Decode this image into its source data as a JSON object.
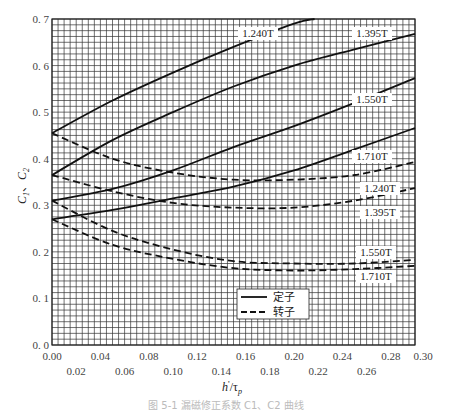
{
  "chart_data": {
    "type": "line",
    "title": "",
    "xlabel": "h'/τp",
    "ylabel": "C1、C2",
    "xlim": [
      0.0,
      0.3
    ],
    "ylim": [
      0.0,
      0.7
    ],
    "grid": true,
    "x_ticks_upper": [
      "0.00",
      "0.04",
      "0.08",
      "0.12",
      "0.16",
      "0.20",
      "0.24",
      "0.28",
      "0.30"
    ],
    "x_ticks_lower": [
      "0.02",
      "0.06",
      "0.10",
      "0.14",
      "0.18",
      "0.22",
      "0.26"
    ],
    "y_ticks": [
      "0.0",
      "0.1",
      "0.2",
      "0.3",
      "0.4",
      "0.5",
      "0.6",
      "0.7"
    ],
    "legend": [
      {
        "label": "定子",
        "style": "solid"
      },
      {
        "label": "转子",
        "style": "dashed"
      }
    ],
    "legend_position": "lower-right inside",
    "series": [
      {
        "name": "定子 1.240T",
        "style": "solid",
        "label": "1.240T",
        "x": [
          0.0,
          0.05,
          0.1,
          0.15,
          0.2,
          0.217
        ],
        "values": [
          0.455,
          0.525,
          0.585,
          0.64,
          0.69,
          0.7
        ]
      },
      {
        "name": "定子 1.395T",
        "style": "solid",
        "label": "1.395T",
        "x": [
          0.0,
          0.05,
          0.1,
          0.15,
          0.2,
          0.25,
          0.3
        ],
        "values": [
          0.365,
          0.44,
          0.5,
          0.555,
          0.6,
          0.635,
          0.668
        ]
      },
      {
        "name": "定子 1.550T",
        "style": "solid",
        "label": "1.550T",
        "x": [
          0.0,
          0.05,
          0.1,
          0.15,
          0.2,
          0.25,
          0.3
        ],
        "values": [
          0.31,
          0.335,
          0.375,
          0.425,
          0.47,
          0.52,
          0.573
        ]
      },
      {
        "name": "定子 1.710T",
        "style": "solid",
        "label": "1.710T",
        "x": [
          0.0,
          0.05,
          0.1,
          0.15,
          0.2,
          0.25,
          0.3
        ],
        "values": [
          0.27,
          0.29,
          0.315,
          0.34,
          0.375,
          0.42,
          0.466
        ]
      },
      {
        "name": "转子 1.240T",
        "style": "dashed",
        "label": "1.240T",
        "x": [
          0.0,
          0.05,
          0.1,
          0.15,
          0.2,
          0.25,
          0.3
        ],
        "values": [
          0.455,
          0.4,
          0.37,
          0.355,
          0.355,
          0.365,
          0.393
        ]
      },
      {
        "name": "转子 1.395T",
        "style": "dashed",
        "label": "1.395T",
        "x": [
          0.0,
          0.05,
          0.1,
          0.15,
          0.2,
          0.25,
          0.3
        ],
        "values": [
          0.365,
          0.33,
          0.305,
          0.295,
          0.295,
          0.31,
          0.337
        ]
      },
      {
        "name": "转子 1.550T",
        "style": "dashed",
        "label": "1.550T",
        "x": [
          0.0,
          0.05,
          0.1,
          0.15,
          0.2,
          0.25,
          0.3
        ],
        "values": [
          0.31,
          0.245,
          0.205,
          0.18,
          0.175,
          0.175,
          0.183
        ]
      },
      {
        "name": "转子 1.710T",
        "style": "dashed",
        "label": "1.710T",
        "x": [
          0.0,
          0.05,
          0.1,
          0.15,
          0.2,
          0.25,
          0.3
        ],
        "values": [
          0.27,
          0.215,
          0.185,
          0.165,
          0.16,
          0.163,
          0.17
        ]
      }
    ],
    "annotations": [
      {
        "text": "1.240T",
        "series": "定子 1.240T"
      },
      {
        "text": "1.395T",
        "series": "定子 1.395T"
      },
      {
        "text": "1.550T",
        "series": "定子 1.550T"
      },
      {
        "text": "1.710T",
        "series": "定子 1.710T"
      },
      {
        "text": "1.240T",
        "series": "转子 1.240T"
      },
      {
        "text": "1.395T",
        "series": "转子 1.395T"
      },
      {
        "text": "1.550T",
        "series": "转子 1.550T"
      },
      {
        "text": "1.710T",
        "series": "转子 1.710T"
      }
    ]
  },
  "axes": {
    "xlabel_main": "h",
    "xlabel_prime": "'",
    "xlabel_sep": "/τ",
    "xlabel_sub": "p",
    "ylabel_c1": "C",
    "ylabel_sub1": "1",
    "ylabel_sep": "、",
    "ylabel_c2": "C",
    "ylabel_sub2": "2"
  },
  "caption": "图 5-1  漏磁修正系数 C1、C2 曲线"
}
